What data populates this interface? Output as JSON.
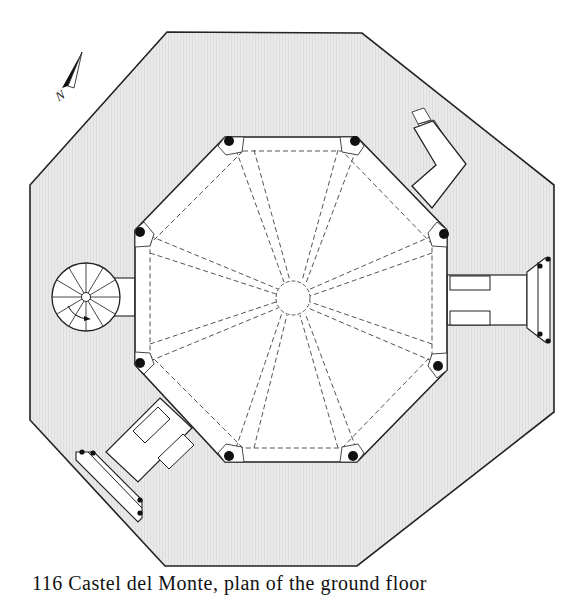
{
  "figure": {
    "type": "architectural floor plan",
    "caption_partial": "116 Castel del Monte, plan of the ground floor",
    "caption_visible": "116 Ca..."
  },
  "compass": {
    "label": "N",
    "icon": "north-arrow-icon"
  },
  "colors": {
    "wall_fill": "#e6e6e6",
    "interior_fill": "#ffffff",
    "line": "#222222",
    "dashed": "#555555",
    "column": "#111111"
  },
  "elements": {
    "outer_wall": "outer-octagon",
    "inner_court": "inner-octagon",
    "center": "central-oculus-circle",
    "spiral_stair": "spiral-staircase",
    "entrances": [
      "east-portal",
      "southwest-portal",
      "northeast-annex"
    ]
  }
}
